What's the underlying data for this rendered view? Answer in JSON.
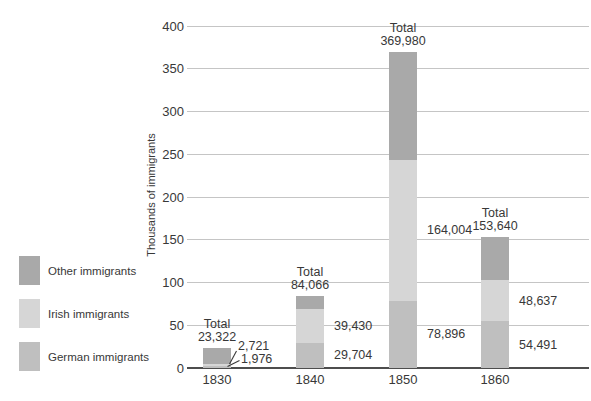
{
  "legend": {
    "items": [
      {
        "label": "Other immigrants",
        "color": "#a9a9a9",
        "key": "other"
      },
      {
        "label": "Irish immigrants",
        "color": "#d6d6d6",
        "key": "irish"
      },
      {
        "label": "German immigrants",
        "color": "#bfbfbf",
        "key": "german"
      }
    ]
  },
  "chart_data": {
    "type": "bar",
    "stacked": true,
    "ylabel": "Thousands of immigrants",
    "yticks": [
      0,
      50,
      100,
      150,
      200,
      250,
      300,
      350,
      400
    ],
    "ylim": [
      0,
      400
    ],
    "grid": true,
    "legend_position": "left",
    "categories": [
      "1830",
      "1840",
      "1850",
      "1860"
    ],
    "series": [
      {
        "name": "German immigrants",
        "key": "german",
        "color": "#bfbfbf",
        "values": [
          1976,
          29704,
          78896,
          54491
        ],
        "labels": [
          "1,976",
          "29,704",
          "78,896",
          "54,491"
        ]
      },
      {
        "name": "Irish immigrants",
        "key": "irish",
        "color": "#d6d6d6",
        "values": [
          2721,
          39430,
          164004,
          48637
        ],
        "labels": [
          "2,721",
          "39,430",
          "164,004",
          "48,637"
        ]
      },
      {
        "name": "Other immigrants",
        "key": "other",
        "color": "#a9a9a9",
        "values": [
          18625,
          14932,
          127080,
          50512
        ],
        "labels": [
          null,
          null,
          null,
          null
        ]
      }
    ],
    "totals": {
      "label": "Total",
      "values": [
        23322,
        84066,
        369980,
        153640
      ],
      "display": [
        "23,322",
        "84,066",
        "369,980",
        "153,640"
      ]
    }
  }
}
